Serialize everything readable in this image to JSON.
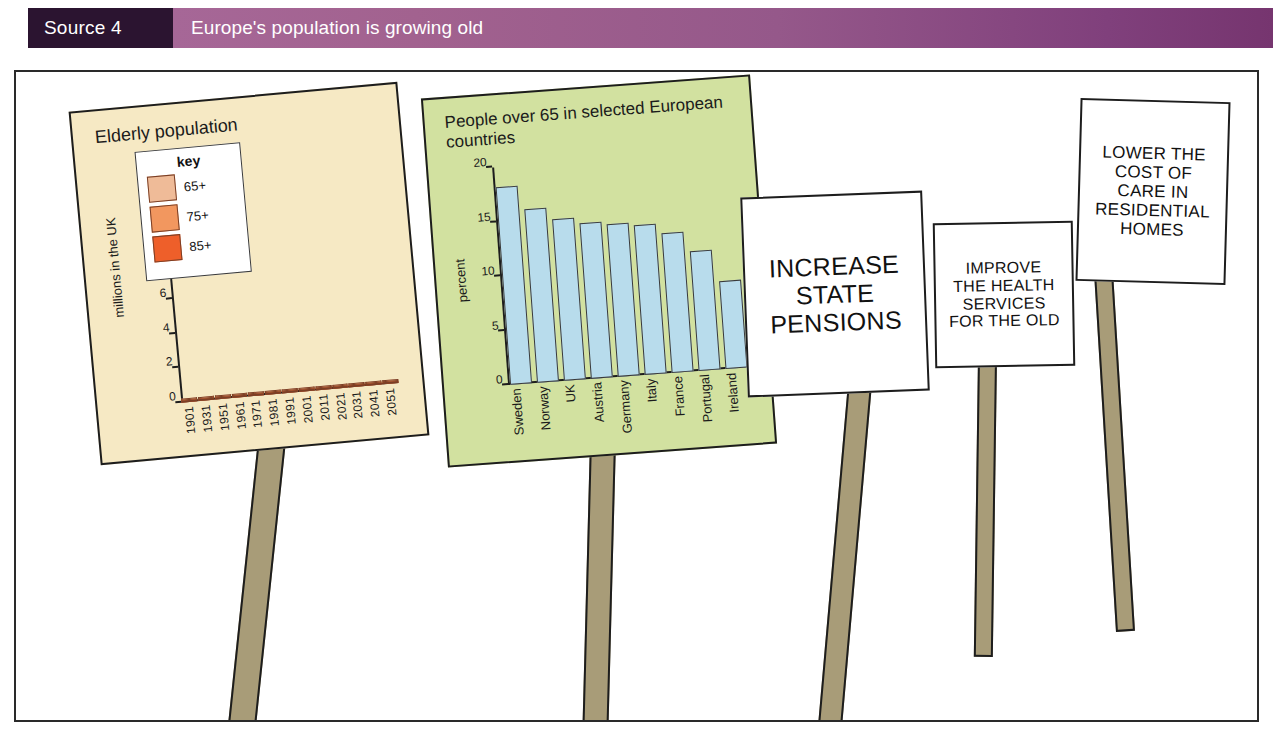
{
  "header": {
    "source_label": "Source 4",
    "title": "Europe's population is growing old",
    "source_box_color": "#2b1430",
    "banner_color": "#95588a"
  },
  "chart_data": [
    {
      "id": "elderly-population",
      "type": "bar",
      "stacked": true,
      "title": "Elderly population",
      "xlabel": "",
      "ylabel": "millions in the UK",
      "ylim": [
        0,
        14
      ],
      "yticks": [
        0,
        2,
        4,
        6,
        8,
        10,
        12
      ],
      "grid": false,
      "background_color": "#f6e9c4",
      "legend": {
        "title": "key",
        "position": "inside-top-left",
        "entries": [
          {
            "name": "65+",
            "color": "#efbb98"
          },
          {
            "name": "75+",
            "color": "#f2975f"
          },
          {
            "name": "85+",
            "color": "#ee5f2a"
          }
        ]
      },
      "categories": [
        "1901",
        "1931",
        "1951",
        "1961",
        "1971",
        "1981",
        "1991",
        "2001",
        "2011",
        "2021",
        "2031",
        "2041",
        "2051"
      ],
      "series": [
        {
          "name": "65+",
          "color": "#efbb98",
          "values": [
            1.3,
            2.3,
            3.4,
            3.7,
            4.2,
            4.3,
            4.5,
            4.6,
            5.0,
            5.4,
            5.9,
            5.2,
            5.1
          ]
        },
        {
          "name": "75+",
          "color": "#f2975f",
          "values": [
            0.5,
            0.8,
            1.3,
            1.7,
            2.1,
            2.6,
            3.0,
            3.2,
            3.4,
            3.9,
            4.7,
            5.3,
            5.0
          ]
        },
        {
          "name": "85+",
          "color": "#ee5f2a",
          "values": [
            0.1,
            0.2,
            0.3,
            0.4,
            0.5,
            0.6,
            0.8,
            1.0,
            1.2,
            1.5,
            1.9,
            2.6,
            3.2
          ]
        }
      ],
      "totals": [
        1.9,
        3.3,
        5.0,
        5.8,
        6.8,
        7.5,
        8.3,
        8.8,
        9.6,
        10.8,
        12.5,
        13.1,
        13.3
      ]
    },
    {
      "id": "people-over-65-europe",
      "type": "bar",
      "stacked": false,
      "title": "People over 65 in selected\nEuropean countries",
      "xlabel": "",
      "ylabel": "percent",
      "ylim": [
        0,
        20
      ],
      "yticks": [
        0,
        5,
        10,
        15,
        20
      ],
      "grid": false,
      "background_color": "#d2e1a0",
      "bar_color": "#b8dcec",
      "categories": [
        "Sweden",
        "Norway",
        "UK",
        "Austria",
        "Germany",
        "Italy",
        "France",
        "Portugal",
        "Ireland"
      ],
      "values": [
        18.2,
        16.0,
        14.9,
        14.3,
        14.0,
        13.8,
        12.8,
        11.0,
        8.1
      ]
    }
  ],
  "placards": [
    {
      "id": "increase-state-pensions",
      "text": "INCREASE\nSTATE\nPENSIONS"
    },
    {
      "id": "improve-health-services",
      "text": "IMPROVE\nTHE HEALTH\nSERVICES\nFOR THE OLD"
    },
    {
      "id": "lower-cost-of-care",
      "text": "LOWER THE\nCOST OF\nCARE IN\nRESIDENTIAL\nHOMES"
    }
  ],
  "colors": {
    "pole": "#a89c78",
    "frame_border": "#2a2a2a",
    "ink": "#1d1d1d"
  }
}
